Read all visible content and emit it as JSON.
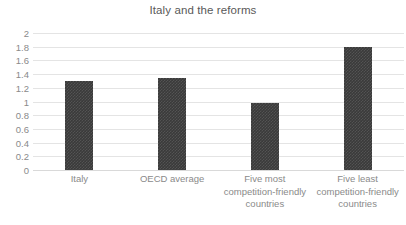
{
  "chart_data": {
    "type": "bar",
    "title": "Italy and the reforms",
    "xlabel": "",
    "ylabel": "",
    "categories": [
      "Italy",
      "OECD average",
      "Five most\ncompetition-friendly\ncountries",
      "Five least\ncompetition-friendly\ncountries"
    ],
    "values": [
      1.3,
      1.35,
      0.98,
      1.8
    ],
    "ylim": [
      0,
      2
    ],
    "ytick_step": 0.2,
    "ytick_labels": [
      "2",
      "1.8",
      "1.6",
      "1.4",
      "1.2",
      "1",
      "0.8",
      "0.6",
      "0.4",
      "0.2",
      "0"
    ],
    "ytick_values": [
      2,
      1.8,
      1.6,
      1.4,
      1.2,
      1,
      0.8,
      0.6,
      0.4,
      0.2,
      0
    ],
    "grid": true,
    "grid_axis": "y",
    "legend": false,
    "legend_position": "none",
    "series": [
      {
        "name": "Regulation indicator",
        "values": [
          1.3,
          1.35,
          0.98,
          1.8
        ]
      }
    ]
  },
  "style": {
    "bar_color": "#3a3a3a",
    "grid_color": "#e4e4e4",
    "baseline_color": "#d9d9d9",
    "title_color": "#595959",
    "tick_color": "#8a8a8a",
    "background": "#ffffff"
  }
}
